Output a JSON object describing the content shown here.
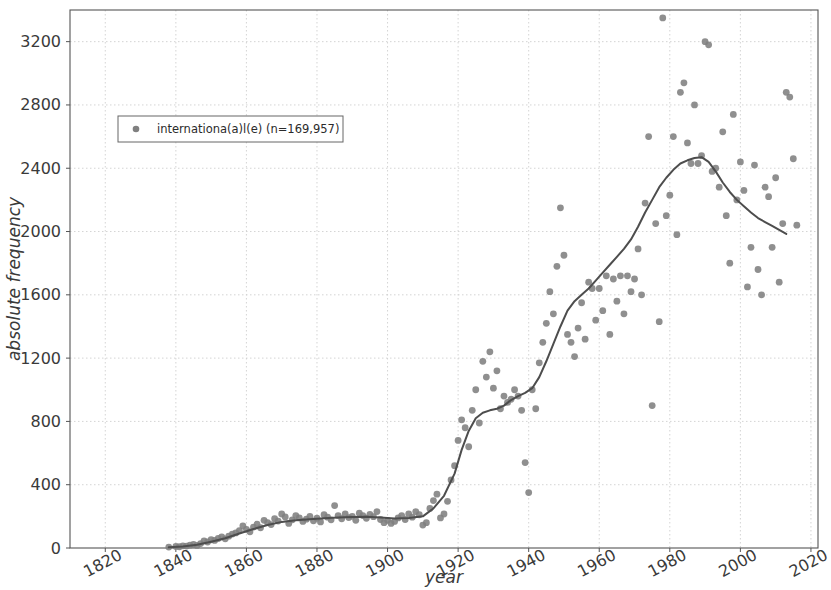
{
  "chart_data": {
    "type": "scatter",
    "title": "",
    "xlabel": "year",
    "ylabel": "absolute frequency",
    "xlim": [
      1810,
      2022
    ],
    "ylim": [
      0,
      3400
    ],
    "xticks": [
      1820,
      1840,
      1860,
      1880,
      1900,
      1920,
      1940,
      1960,
      1980,
      2000,
      2020
    ],
    "yticks": [
      0,
      400,
      800,
      1200,
      1600,
      2000,
      2400,
      2800,
      3200
    ],
    "grid": true,
    "legend_position": "upper left",
    "series": [
      {
        "name": "internationa(a)l(e) (n=169,957)",
        "marker": "circle",
        "color": "#808080",
        "points": [
          [
            1838,
            6
          ],
          [
            1840,
            10
          ],
          [
            1841,
            8
          ],
          [
            1842,
            14
          ],
          [
            1843,
            12
          ],
          [
            1844,
            18
          ],
          [
            1845,
            22
          ],
          [
            1846,
            16
          ],
          [
            1847,
            28
          ],
          [
            1848,
            45
          ],
          [
            1849,
            38
          ],
          [
            1850,
            52
          ],
          [
            1851,
            48
          ],
          [
            1852,
            60
          ],
          [
            1853,
            70
          ],
          [
            1854,
            58
          ],
          [
            1855,
            75
          ],
          [
            1856,
            88
          ],
          [
            1857,
            95
          ],
          [
            1858,
            110
          ],
          [
            1859,
            140
          ],
          [
            1860,
            118
          ],
          [
            1861,
            102
          ],
          [
            1862,
            132
          ],
          [
            1863,
            150
          ],
          [
            1864,
            128
          ],
          [
            1865,
            175
          ],
          [
            1866,
            160
          ],
          [
            1867,
            148
          ],
          [
            1868,
            185
          ],
          [
            1869,
            170
          ],
          [
            1870,
            215
          ],
          [
            1871,
            196
          ],
          [
            1872,
            155
          ],
          [
            1873,
            178
          ],
          [
            1874,
            205
          ],
          [
            1875,
            190
          ],
          [
            1876,
            168
          ],
          [
            1877,
            182
          ],
          [
            1878,
            200
          ],
          [
            1879,
            172
          ],
          [
            1880,
            188
          ],
          [
            1881,
            165
          ],
          [
            1882,
            210
          ],
          [
            1883,
            195
          ],
          [
            1884,
            178
          ],
          [
            1885,
            268
          ],
          [
            1886,
            205
          ],
          [
            1887,
            185
          ],
          [
            1888,
            215
          ],
          [
            1889,
            192
          ],
          [
            1890,
            200
          ],
          [
            1891,
            175
          ],
          [
            1892,
            220
          ],
          [
            1893,
            205
          ],
          [
            1894,
            188
          ],
          [
            1895,
            212
          ],
          [
            1896,
            198
          ],
          [
            1897,
            230
          ],
          [
            1898,
            180
          ],
          [
            1899,
            160
          ],
          [
            1900,
            175
          ],
          [
            1901,
            155
          ],
          [
            1902,
            168
          ],
          [
            1903,
            190
          ],
          [
            1904,
            205
          ],
          [
            1905,
            180
          ],
          [
            1906,
            215
          ],
          [
            1907,
            195
          ],
          [
            1908,
            230
          ],
          [
            1909,
            210
          ],
          [
            1910,
            145
          ],
          [
            1911,
            160
          ],
          [
            1912,
            250
          ],
          [
            1913,
            300
          ],
          [
            1914,
            340
          ],
          [
            1915,
            190
          ],
          [
            1916,
            215
          ],
          [
            1917,
            295
          ],
          [
            1918,
            430
          ],
          [
            1919,
            520
          ],
          [
            1920,
            680
          ],
          [
            1921,
            810
          ],
          [
            1922,
            760
          ],
          [
            1923,
            640
          ],
          [
            1924,
            870
          ],
          [
            1925,
            1000
          ],
          [
            1926,
            790
          ],
          [
            1927,
            1180
          ],
          [
            1928,
            1080
          ],
          [
            1929,
            1240
          ],
          [
            1930,
            1010
          ],
          [
            1931,
            1120
          ],
          [
            1932,
            880
          ],
          [
            1933,
            960
          ],
          [
            1934,
            920
          ],
          [
            1935,
            940
          ],
          [
            1936,
            1000
          ],
          [
            1937,
            960
          ],
          [
            1938,
            870
          ],
          [
            1939,
            540
          ],
          [
            1940,
            350
          ],
          [
            1941,
            1000
          ],
          [
            1942,
            880
          ],
          [
            1943,
            1170
          ],
          [
            1944,
            1300
          ],
          [
            1945,
            1420
          ],
          [
            1946,
            1620
          ],
          [
            1947,
            1480
          ],
          [
            1948,
            1780
          ],
          [
            1949,
            2150
          ],
          [
            1950,
            1850
          ],
          [
            1951,
            1350
          ],
          [
            1952,
            1300
          ],
          [
            1953,
            1210
          ],
          [
            1954,
            1390
          ],
          [
            1955,
            1550
          ],
          [
            1956,
            1320
          ],
          [
            1957,
            1680
          ],
          [
            1958,
            1640
          ],
          [
            1959,
            1440
          ],
          [
            1960,
            1640
          ],
          [
            1961,
            1500
          ],
          [
            1962,
            1720
          ],
          [
            1963,
            1350
          ],
          [
            1964,
            1700
          ],
          [
            1965,
            1560
          ],
          [
            1966,
            1720
          ],
          [
            1967,
            1480
          ],
          [
            1968,
            1720
          ],
          [
            1969,
            1620
          ],
          [
            1970,
            1700
          ],
          [
            1971,
            1890
          ],
          [
            1972,
            1600
          ],
          [
            1973,
            2180
          ],
          [
            1974,
            2600
          ],
          [
            1975,
            900
          ],
          [
            1976,
            2050
          ],
          [
            1977,
            1430
          ],
          [
            1978,
            3350
          ],
          [
            1979,
            2100
          ],
          [
            1980,
            2230
          ],
          [
            1981,
            2600
          ],
          [
            1982,
            1980
          ],
          [
            1983,
            2880
          ],
          [
            1984,
            2940
          ],
          [
            1985,
            2560
          ],
          [
            1986,
            2430
          ],
          [
            1987,
            2800
          ],
          [
            1988,
            2430
          ],
          [
            1989,
            2480
          ],
          [
            1990,
            3200
          ],
          [
            1991,
            3180
          ],
          [
            1992,
            2380
          ],
          [
            1993,
            2400
          ],
          [
            1994,
            2280
          ],
          [
            1995,
            2630
          ],
          [
            1996,
            2100
          ],
          [
            1997,
            1800
          ],
          [
            1998,
            2740
          ],
          [
            1999,
            2200
          ],
          [
            2000,
            2440
          ],
          [
            2001,
            2260
          ],
          [
            2002,
            1650
          ],
          [
            2003,
            1900
          ],
          [
            2004,
            2420
          ],
          [
            2005,
            1760
          ],
          [
            2006,
            1600
          ],
          [
            2007,
            2280
          ],
          [
            2008,
            2220
          ],
          [
            2009,
            1900
          ],
          [
            2010,
            2340
          ],
          [
            2011,
            1680
          ],
          [
            2012,
            2050
          ],
          [
            2013,
            2880
          ],
          [
            2014,
            2850
          ],
          [
            2015,
            2460
          ],
          [
            2016,
            2040
          ]
        ],
        "trend": {
          "type": "loess",
          "color": "#4d4d4d",
          "points": [
            [
              1838,
              4
            ],
            [
              1842,
              10
            ],
            [
              1846,
              20
            ],
            [
              1850,
              40
            ],
            [
              1854,
              62
            ],
            [
              1858,
              92
            ],
            [
              1862,
              120
            ],
            [
              1866,
              145
            ],
            [
              1870,
              165
            ],
            [
              1874,
              175
            ],
            [
              1878,
              182
            ],
            [
              1882,
              188
            ],
            [
              1886,
              192
            ],
            [
              1890,
              196
            ],
            [
              1894,
              198
            ],
            [
              1898,
              192
            ],
            [
              1902,
              186
            ],
            [
              1906,
              190
            ],
            [
              1910,
              200
            ],
            [
              1913,
              250
            ],
            [
              1916,
              330
            ],
            [
              1919,
              470
            ],
            [
              1921,
              620
            ],
            [
              1923,
              740
            ],
            [
              1925,
              820
            ],
            [
              1927,
              855
            ],
            [
              1929,
              870
            ],
            [
              1931,
              880
            ],
            [
              1933,
              900
            ],
            [
              1935,
              935
            ],
            [
              1937,
              960
            ],
            [
              1939,
              980
            ],
            [
              1941,
              1010
            ],
            [
              1943,
              1080
            ],
            [
              1945,
              1180
            ],
            [
              1947,
              1290
            ],
            [
              1949,
              1400
            ],
            [
              1951,
              1500
            ],
            [
              1953,
              1560
            ],
            [
              1955,
              1600
            ],
            [
              1957,
              1640
            ],
            [
              1959,
              1690
            ],
            [
              1961,
              1740
            ],
            [
              1963,
              1790
            ],
            [
              1965,
              1840
            ],
            [
              1967,
              1890
            ],
            [
              1969,
              1950
            ],
            [
              1971,
              2030
            ],
            [
              1973,
              2120
            ],
            [
              1975,
              2200
            ],
            [
              1977,
              2280
            ],
            [
              1979,
              2340
            ],
            [
              1981,
              2390
            ],
            [
              1983,
              2430
            ],
            [
              1985,
              2450
            ],
            [
              1987,
              2465
            ],
            [
              1989,
              2470
            ],
            [
              1991,
              2440
            ],
            [
              1993,
              2380
            ],
            [
              1995,
              2310
            ],
            [
              1997,
              2250
            ],
            [
              1999,
              2200
            ],
            [
              2001,
              2160
            ],
            [
              2003,
              2120
            ],
            [
              2005,
              2085
            ],
            [
              2007,
              2060
            ],
            [
              2009,
              2035
            ],
            [
              2011,
              2010
            ],
            [
              2013,
              1985
            ]
          ]
        }
      }
    ]
  },
  "legend": {
    "entries": [
      {
        "label": "internationa(a)l(e) (n=169,957)",
        "marker_color": "#808080"
      }
    ]
  },
  "axes": {
    "x_label": "year",
    "y_label": "absolute frequency",
    "x_tick_labels": [
      "1820",
      "1840",
      "1860",
      "1880",
      "1900",
      "1920",
      "1940",
      "1960",
      "1980",
      "2000",
      "2020"
    ],
    "y_tick_labels": [
      "0",
      "400",
      "800",
      "1200",
      "1600",
      "2000",
      "2400",
      "2800",
      "3200"
    ]
  },
  "colors": {
    "point": "#808080",
    "trend_line": "#4d4d4d",
    "grid": "#cfcfcf",
    "frame": "#555555",
    "text": "#3a3a3a",
    "background": "#ffffff"
  }
}
